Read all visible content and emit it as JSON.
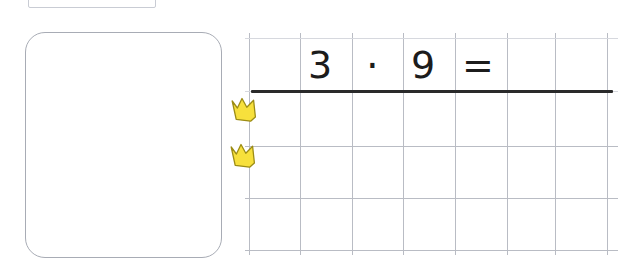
{
  "page": {
    "background_color": "#ffffff"
  },
  "top_label_box": {
    "name": "clipped-label-box",
    "text": "",
    "border_color": "#c9ccd4"
  },
  "answer_card": {
    "name": "answer-card",
    "text": "",
    "border_color": "#a8acb5"
  },
  "equation": {
    "tokens": [
      {
        "glyph": "3",
        "meaning": "first-factor"
      },
      {
        "glyph": "·",
        "meaning": "multiplication-dot"
      },
      {
        "glyph": "9",
        "meaning": "second-factor"
      },
      {
        "glyph": "=",
        "meaning": "equals-sign"
      }
    ],
    "full_text": "3 · 9 =",
    "result": "",
    "text_color": "#1c1c1c"
  },
  "answer_rule": {
    "name": "answer-rule-line",
    "color": "#2a2a2a"
  },
  "grid": {
    "line_color": "#b9bcc4",
    "faint_line_color": "#d6d8de",
    "vertical_x": [
      4,
      55,
      107,
      158,
      210,
      262,
      310,
      362
    ],
    "horizontal_y": [
      5,
      58,
      113,
      165,
      217
    ],
    "columns": 7,
    "rows": 4
  },
  "markers": [
    {
      "icon": "crown-icon",
      "color": "#f7e03c",
      "outline": "#b8a41e",
      "label": ""
    },
    {
      "icon": "crown-icon",
      "color": "#f7e03c",
      "outline": "#b8a41e",
      "label": ""
    }
  ]
}
